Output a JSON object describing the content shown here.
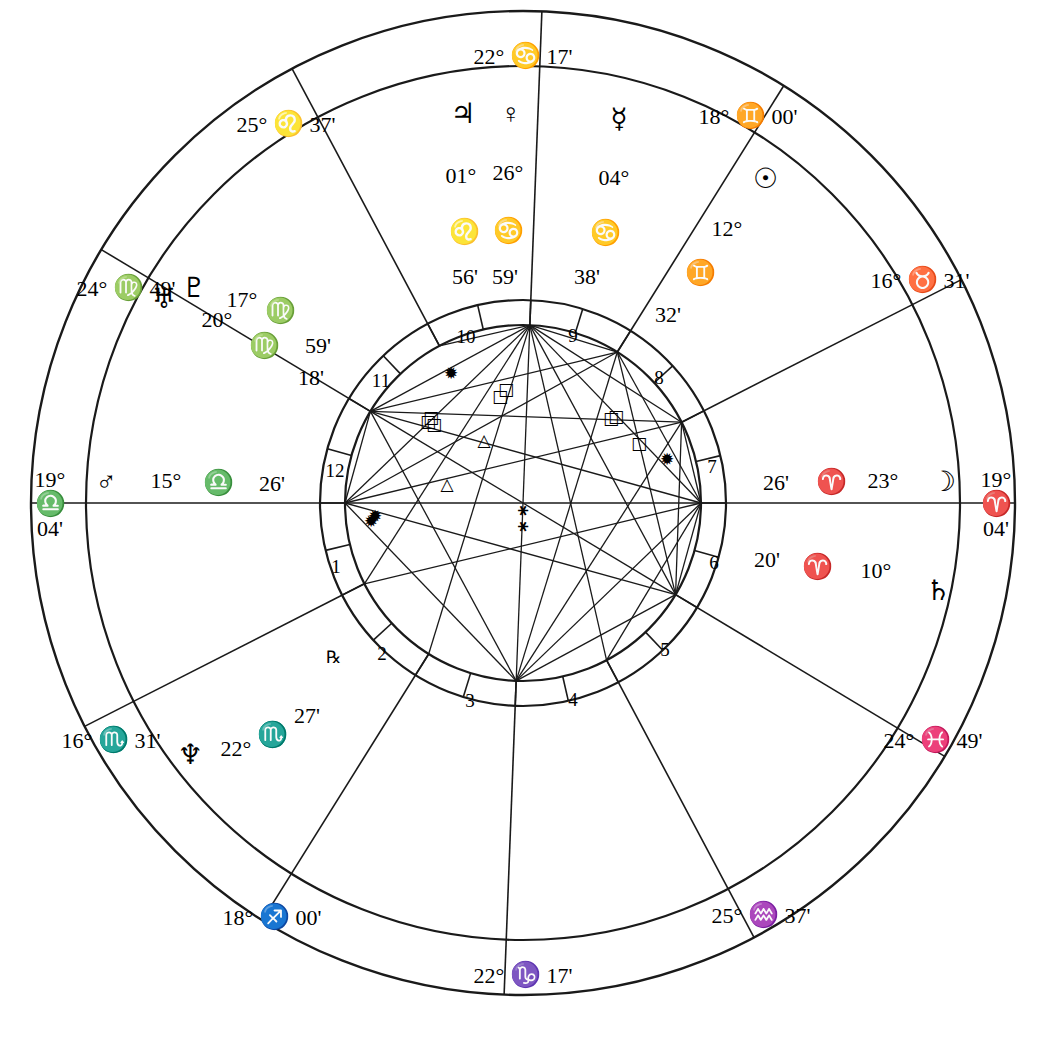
{
  "chart": {
    "type": "astrological-natal-wheel",
    "center": {
      "x": 523,
      "y": 503
    },
    "radii": {
      "outer": 492,
      "zodiac_inner": 437,
      "house_ring_outer": 203,
      "house_ring_inner": 178
    }
  },
  "axis_labels": {
    "mc": {
      "degree": "22°",
      "sign": "♋",
      "minute": "17'",
      "x": 523,
      "y": 56
    },
    "ic": {
      "degree": "22°",
      "sign": "♑",
      "minute": "17'",
      "x": 523,
      "y": 975
    },
    "asc_outer": {
      "degree": "19°",
      "sign": "♎",
      "minute": "04'",
      "x": 50,
      "y": 504
    },
    "dsc_outer": {
      "degree": "19°",
      "sign": "♈",
      "minute": "04'",
      "x": 996,
      "y": 504
    }
  },
  "cusps": [
    {
      "name": "cusp-25-leo-37",
      "degree": "25°",
      "sign": "♌",
      "minute": "37'",
      "x": 286,
      "y": 124
    },
    {
      "name": "cusp-18-gemini-00",
      "degree": "18°",
      "sign": "♊",
      "minute": "00'",
      "x": 748,
      "y": 116
    },
    {
      "name": "cusp-24-virgo-49",
      "degree": "24°",
      "sign": "♍",
      "minute": "49'",
      "x": 126,
      "y": 288
    },
    {
      "name": "cusp-16-taurus-31",
      "degree": "16°",
      "sign": "♉",
      "minute": "31'",
      "x": 920,
      "y": 280
    },
    {
      "name": "cusp-16-scorpio-31",
      "degree": "16°",
      "sign": "♏",
      "minute": "31'",
      "x": 111,
      "y": 740
    },
    {
      "name": "cusp-24-pisces-49",
      "degree": "24°",
      "sign": "♓",
      "minute": "49'",
      "x": 933,
      "y": 740
    },
    {
      "name": "cusp-18-sagittarius-00",
      "degree": "18°",
      "sign": "♐",
      "minute": "00'",
      "x": 272,
      "y": 917
    },
    {
      "name": "cusp-25-aquarius-37",
      "degree": "25°",
      "sign": "♒",
      "minute": "37'",
      "x": 761,
      "y": 915
    }
  ],
  "planets": [
    {
      "name": "jupiter",
      "glyph": "♃",
      "degree": "01°",
      "sign": "♌",
      "minute": "56'",
      "glyph_x": 463,
      "glyph_y": 114,
      "deg_x": 461,
      "deg_y": 176,
      "sign_x": 464,
      "sign_y": 231,
      "min_x": 465,
      "min_y": 277,
      "retro": false
    },
    {
      "name": "venus",
      "glyph": "♀",
      "degree": "26°",
      "sign": "♋",
      "minute": "59'",
      "glyph_x": 511,
      "glyph_y": 114,
      "deg_x": 508,
      "deg_y": 173,
      "sign_x": 508,
      "sign_y": 230,
      "min_x": 505,
      "min_y": 277,
      "retro": false
    },
    {
      "name": "mercury",
      "glyph": "☿",
      "degree": "04°",
      "sign": "♋",
      "minute": "38'",
      "glyph_x": 619,
      "glyph_y": 119,
      "deg_x": 614,
      "deg_y": 178,
      "sign_x": 605,
      "sign_y": 232,
      "min_x": 587,
      "min_y": 277,
      "retro": false
    },
    {
      "name": "sun",
      "glyph": "☉",
      "degree": "12°",
      "sign": "♊",
      "minute": "32'",
      "glyph_x": 765,
      "glyph_y": 179,
      "deg_x": 727,
      "deg_y": 229,
      "sign_x": 700,
      "sign_y": 272,
      "min_x": 668,
      "min_y": 315,
      "retro": false
    },
    {
      "name": "moon",
      "glyph": "☽",
      "degree": "23°",
      "sign": "♈",
      "minute": "26'",
      "glyph_x": 943,
      "glyph_y": 482,
      "deg_x": 883,
      "deg_y": 481,
      "sign_x": 831,
      "sign_y": 481,
      "min_x": 776,
      "min_y": 483,
      "retro": false
    },
    {
      "name": "saturn",
      "glyph": "♄",
      "degree": "10°",
      "sign": "♈",
      "minute": "20'",
      "glyph_x": 938,
      "glyph_y": 591,
      "deg_x": 876,
      "deg_y": 571,
      "sign_x": 817,
      "sign_y": 566,
      "min_x": 767,
      "min_y": 560,
      "retro": false
    },
    {
      "name": "neptune",
      "glyph": "♆",
      "degree": "22°",
      "sign": "♏",
      "minute": "27'",
      "glyph_x": 190,
      "glyph_y": 755,
      "deg_x": 236,
      "deg_y": 749,
      "sign_x": 272,
      "sign_y": 734,
      "min_x": 307,
      "min_y": 716,
      "retro": true,
      "retro_x": 333,
      "retro_y": 657
    },
    {
      "name": "mars",
      "glyph": "♂",
      "degree": "15°",
      "sign": "♎",
      "minute": "26'",
      "glyph_x": 106,
      "glyph_y": 482,
      "deg_x": 166,
      "deg_y": 481,
      "sign_x": 218,
      "sign_y": 482,
      "min_x": 272,
      "min_y": 484,
      "retro": false
    },
    {
      "name": "pluto",
      "glyph": "♇",
      "degree": "17°",
      "sign": "♍",
      "minute": "59'",
      "glyph_x": 194,
      "glyph_y": 288,
      "deg_x": 242,
      "deg_y": 300,
      "sign_x": 280,
      "sign_y": 310,
      "min_x": 318,
      "min_y": 346,
      "retro": false
    },
    {
      "name": "uranus",
      "glyph": "♅",
      "degree": "20°",
      "sign": "♍",
      "minute": "18'",
      "glyph_x": 164,
      "glyph_y": 299,
      "deg_x": 217,
      "deg_y": 320,
      "sign_x": 264,
      "sign_y": 345,
      "min_x": 311,
      "min_y": 378,
      "retro": false
    }
  ],
  "house_numbers": [
    {
      "label": "10",
      "x": 466,
      "y": 336
    },
    {
      "label": "9",
      "x": 573,
      "y": 335
    },
    {
      "label": "11",
      "x": 381,
      "y": 380
    },
    {
      "label": "8",
      "x": 659,
      "y": 377
    },
    {
      "label": "12",
      "x": 335,
      "y": 470
    },
    {
      "label": "7",
      "x": 712,
      "y": 466
    },
    {
      "label": "1",
      "x": 336,
      "y": 566
    },
    {
      "label": "6",
      "x": 714,
      "y": 562
    },
    {
      "label": "2",
      "x": 382,
      "y": 653
    },
    {
      "label": "5",
      "x": 665,
      "y": 649
    },
    {
      "label": "3",
      "x": 470,
      "y": 700
    },
    {
      "label": "4",
      "x": 573,
      "y": 699
    }
  ],
  "aspect_markers": [
    {
      "kind": "sextile",
      "glyph": "✹",
      "x": 451,
      "y": 373
    },
    {
      "kind": "square",
      "glyph": "□",
      "x": 500,
      "y": 396
    },
    {
      "kind": "square",
      "glyph": "□",
      "x": 506,
      "y": 389
    },
    {
      "kind": "square-cluster",
      "glyph": "□",
      "x": 428,
      "y": 421
    },
    {
      "kind": "square-cluster",
      "glyph": "□",
      "x": 434,
      "y": 424
    },
    {
      "kind": "square-cluster",
      "glyph": "□",
      "x": 431,
      "y": 417
    },
    {
      "kind": "trine",
      "glyph": "△",
      "x": 484,
      "y": 440
    },
    {
      "kind": "trine",
      "glyph": "△",
      "x": 447,
      "y": 484
    },
    {
      "kind": "square-cluster",
      "glyph": "□",
      "x": 611,
      "y": 418
    },
    {
      "kind": "square-cluster",
      "glyph": "□",
      "x": 616,
      "y": 416
    },
    {
      "kind": "square",
      "glyph": "□",
      "x": 639,
      "y": 443
    },
    {
      "kind": "sextile",
      "glyph": "✹",
      "x": 667,
      "y": 459
    },
    {
      "kind": "sextile",
      "glyph": "✹",
      "x": 375,
      "y": 516
    },
    {
      "kind": "sextile",
      "glyph": "✹",
      "x": 371,
      "y": 521
    },
    {
      "kind": "semisextile",
      "glyph": "⚹",
      "x": 523,
      "y": 509
    },
    {
      "kind": "semisextile",
      "glyph": "⚹",
      "x": 523,
      "y": 525
    }
  ],
  "house_cusp_angles_deg": [
    180.0,
    211.0,
    242.0,
    272.2,
    302.0,
    333.0,
    0.0,
    31.0,
    62.0,
    92.2,
    122.0,
    153.0
  ],
  "colors": {
    "stroke": "#1a1a1a",
    "background": "#ffffff"
  }
}
